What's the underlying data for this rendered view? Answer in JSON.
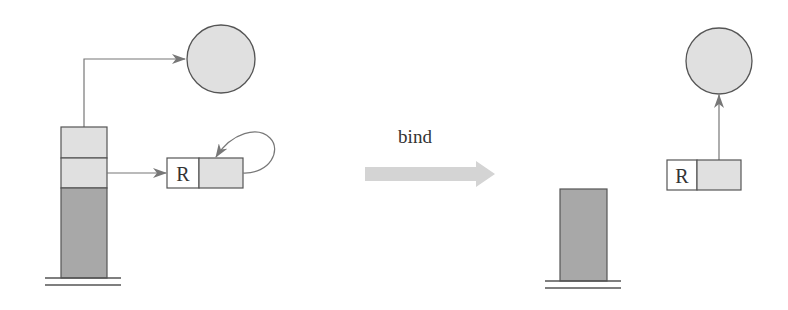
{
  "diagram": {
    "transition_label": "bind",
    "before": {
      "register_label": "R",
      "description": "Stack with two light cells above dark region; top cell points to a heap object (circle), second cell points to a box R whose right cell self-loops."
    },
    "after": {
      "register_label": "R",
      "description": "Stack reduced to dark region; box R's right cell points to the heap object (circle)."
    }
  },
  "colors": {
    "stroke": "#555555",
    "light_fill": "#e0e0e0",
    "dark_fill": "#a8a8a8",
    "arrow": "#777777",
    "bind_arrow": "#d4d4d4",
    "white": "#ffffff"
  }
}
